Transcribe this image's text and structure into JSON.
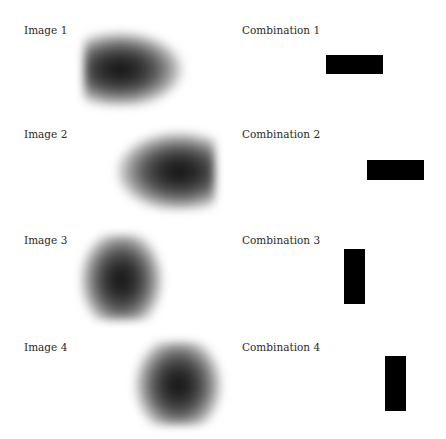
{
  "panels": [
    {
      "image_label": "Image 1",
      "combination_label": "Combination 1",
      "blob": {
        "x": 84,
        "y": 30,
        "w": 106,
        "h": 76,
        "orientation": "horizontal",
        "center_x_pct": 34,
        "center_y_pct": 52
      },
      "rect": {
        "x": 326,
        "y": 55,
        "w": 57,
        "h": 19,
        "orientation": "horizontal"
      }
    },
    {
      "image_label": "Image 2",
      "combination_label": "Combination 2",
      "blob": {
        "x": 110,
        "y": 130,
        "w": 105,
        "h": 80,
        "orientation": "horizontal",
        "center_x_pct": 65,
        "center_y_pct": 52
      },
      "rect": {
        "x": 367,
        "y": 160,
        "w": 57,
        "h": 20,
        "orientation": "horizontal"
      }
    },
    {
      "image_label": "Image 3",
      "combination_label": "Combination 3",
      "blob": {
        "x": 80,
        "y": 235,
        "w": 90,
        "h": 85,
        "orientation": "vertical",
        "center_x_pct": 45,
        "center_y_pct": 53
      },
      "rect": {
        "x": 344,
        "y": 249,
        "w": 21,
        "h": 55,
        "orientation": "vertical"
      }
    },
    {
      "image_label": "Image 4",
      "combination_label": "Combination 4",
      "blob": {
        "x": 127,
        "y": 342,
        "w": 95,
        "h": 83,
        "orientation": "vertical",
        "center_x_pct": 54,
        "center_y_pct": 52
      },
      "rect": {
        "x": 385,
        "y": 356,
        "w": 21,
        "h": 55,
        "orientation": "vertical"
      }
    }
  ],
  "colors": {
    "background": "#ffffff",
    "blob_dark": "#1e1e1e",
    "rect_fill": "#000000",
    "label_text": "#2a2a2a"
  }
}
